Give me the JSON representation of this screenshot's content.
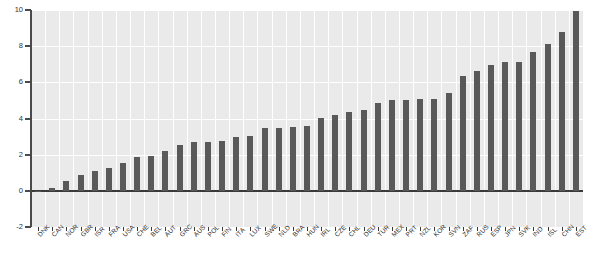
{
  "chart_data": {
    "type": "bar",
    "title": "",
    "subtitle": "",
    "xlabel": "",
    "ylabel": "",
    "ylim": [
      -2,
      10
    ],
    "yticks": [
      -2,
      0,
      2,
      4,
      6,
      8,
      10
    ],
    "ytick_labels": [
      "-2",
      "0",
      "2",
      "4",
      "6",
      "8",
      "10"
    ],
    "grid": true,
    "legend": null,
    "bar_color": "#595959",
    "plot_background": "#eaeaea",
    "gridline_color": "#ffffff",
    "categories": [
      "DNK",
      "CAN",
      "NOR",
      "GBR",
      "ISR",
      "FRA",
      "USA",
      "CHE",
      "BEL",
      "AUT",
      "GRC",
      "AUS",
      "POL",
      "FIN",
      "ITA",
      "LUX",
      "SWE",
      "NLD",
      "BRA",
      "HUN",
      "IRL",
      "CZE",
      "CHL",
      "DEU",
      "TUR",
      "MEX",
      "PRT",
      "NZL",
      "KOR",
      "SVN",
      "ZAF",
      "RUS",
      "ESP",
      "JPN",
      "SVK",
      "IND",
      "ISL",
      "CHN",
      "EST"
    ],
    "values": [
      -0.05,
      0.15,
      0.55,
      0.85,
      1.1,
      1.25,
      1.55,
      1.85,
      1.95,
      2.2,
      2.55,
      2.7,
      2.7,
      2.75,
      3.0,
      3.05,
      3.5,
      3.5,
      3.55,
      3.6,
      4.05,
      4.2,
      4.35,
      4.45,
      4.85,
      5.05,
      5.05,
      5.1,
      5.1,
      5.4,
      6.35,
      6.6,
      6.95,
      7.1,
      7.15,
      7.7,
      8.1,
      8.8,
      9.95
    ]
  }
}
